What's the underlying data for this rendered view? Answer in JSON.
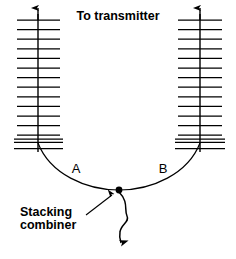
{
  "diagram": {
    "title": "To transmitter",
    "background_color": "#ffffff",
    "stroke_color": "#000000",
    "labels": {
      "left_leg": "A",
      "right_leg": "B",
      "callout_line_1": "Stacking",
      "callout_line_2": "combiner"
    },
    "arrays": [
      {
        "name": "left-antenna-array",
        "mast_x": 38,
        "mast_top_y": 10,
        "mast_bottom_y": 152,
        "rung_left_x": 17,
        "rung_right_x": 60,
        "rung_count": 13,
        "rung_top_y": 20,
        "rung_spacing": 9.6,
        "feed_bar_y": 140,
        "direction_arrow": "up"
      },
      {
        "name": "right-antenna-array",
        "mast_x": 200,
        "mast_top_y": 10,
        "mast_bottom_y": 152,
        "rung_left_x": 178,
        "rung_right_x": 222,
        "rung_count": 13,
        "rung_top_y": 20,
        "rung_spacing": 9.6,
        "feed_bar_y": 140,
        "direction_arrow": "up"
      }
    ],
    "harness": {
      "name": "phasing-harness",
      "left_start": [
        38,
        143
      ],
      "right_start": [
        200,
        143
      ],
      "junction": [
        119,
        190
      ],
      "junction_dot_radius": 3.4
    },
    "feedline": {
      "name": "coax-feedline",
      "start": [
        119,
        191
      ],
      "end": [
        121,
        246
      ],
      "arrow": "down-left"
    },
    "callout_arrow": {
      "name": "callout-leader",
      "from": [
        88,
        213
      ],
      "to": [
        113,
        194
      ]
    }
  }
}
